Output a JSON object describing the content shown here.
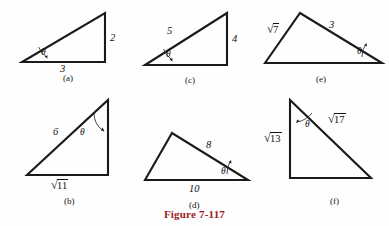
{
  "figure": {
    "caption": "Figure 7-117",
    "caption_color": "#9b1b1b",
    "angle_symbol": "θ",
    "width": 389,
    "height": 226
  },
  "panels": [
    {
      "key": "a",
      "label": "(a)",
      "label_pos": {
        "x": 63,
        "y": 73
      },
      "vertices": [
        {
          "x": 22,
          "y": 62
        },
        {
          "x": 105,
          "y": 62
        },
        {
          "x": 105,
          "y": 13
        }
      ],
      "theta_vertex": {
        "x": 22,
        "y": 62
      },
      "theta_label_pos": {
        "x": 41,
        "y": 47
      },
      "arc": "M 47,57.5 A 26,26 0 0 1 38.5,47",
      "arrow": "M 47.5,58.5 L 44.5,56.6 L 47.4,55.2 Z",
      "sides": [
        {
          "text": "2",
          "x": 110,
          "y": 32,
          "radical": false,
          "italic": true
        },
        {
          "text": "3",
          "x": 60,
          "y": 63,
          "radical": false,
          "italic": true
        }
      ]
    },
    {
      "key": "b",
      "label": "(b)",
      "label_pos": {
        "x": 64,
        "y": 196
      },
      "vertices": [
        {
          "x": 27,
          "y": 175
        },
        {
          "x": 108,
          "y": 175
        },
        {
          "x": 108,
          "y": 100
        }
      ],
      "theta_vertex": {
        "x": 108,
        "y": 100
      },
      "theta_label_pos": {
        "x": 80,
        "y": 127
      },
      "arc": "M 94,112 A 22,22 0 0 0 103.5,131",
      "arrow": "M 104.5,131.5 L 100.8,130.2 L 102.7,127.6 Z",
      "sides": [
        {
          "text": "6",
          "x": 53,
          "y": 126,
          "radical": false,
          "italic": true
        },
        {
          "text": "11",
          "x": 50,
          "y": 178,
          "radical": true,
          "italic": false
        }
      ]
    },
    {
      "key": "c",
      "label": "(c)",
      "label_pos": {
        "x": 185,
        "y": 75
      },
      "vertices": [
        {
          "x": 145,
          "y": 65
        },
        {
          "x": 227,
          "y": 65
        },
        {
          "x": 227,
          "y": 13
        }
      ],
      "theta_vertex": {
        "x": 145,
        "y": 65
      },
      "theta_label_pos": {
        "x": 166,
        "y": 49
      },
      "arc": "M 172,60 A 27,27 0 0 1 163.5,49",
      "arrow": "M 172.5,61.5 L 169.5,59.5 L 172.4,58 Z",
      "sides": [
        {
          "text": "5",
          "x": 167,
          "y": 25,
          "radical": false,
          "italic": true
        },
        {
          "text": "4",
          "x": 232,
          "y": 33,
          "radical": false,
          "italic": true
        }
      ]
    },
    {
      "key": "d",
      "label": "(d)",
      "label_pos": {
        "x": 189,
        "y": 200
      },
      "vertices": [
        {
          "x": 145,
          "y": 180
        },
        {
          "x": 172,
          "y": 133
        },
        {
          "x": 248,
          "y": 180
        }
      ],
      "theta_vertex": {
        "x": 248,
        "y": 180
      },
      "theta_label_pos": {
        "x": 221,
        "y": 166
      },
      "arc": "M 227,174 A 22,22 0 0 1 230.5,161",
      "arrow": "M 231,160 L 231.5,163.5 L 228.6,162.3 Z",
      "sides": [
        {
          "text": "8",
          "x": 206,
          "y": 139,
          "radical": false,
          "italic": true
        },
        {
          "text": "10",
          "x": 189,
          "y": 183,
          "radical": false,
          "italic": true
        }
      ]
    },
    {
      "key": "e",
      "label": "(e)",
      "label_pos": {
        "x": 316,
        "y": 74
      },
      "vertices": [
        {
          "x": 265,
          "y": 63
        },
        {
          "x": 300,
          "y": 13
        },
        {
          "x": 382,
          "y": 63
        }
      ],
      "theta_vertex": {
        "x": 382,
        "y": 63
      },
      "theta_label_pos": {
        "x": 357,
        "y": 46
      },
      "arc": "M 362,57 A 21,21 0 0 1 366,44",
      "arrow": "M 366.5,43 L 367,46.6 L 364.1,45.3 Z",
      "sides": [
        {
          "text": "7",
          "x": 266,
          "y": 22,
          "radical": true,
          "italic": false
        },
        {
          "text": "3",
          "x": 329,
          "y": 19,
          "radical": false,
          "italic": true
        }
      ]
    },
    {
      "key": "f",
      "label": "(f)",
      "label_pos": {
        "x": 330,
        "y": 196
      },
      "vertices": [
        {
          "x": 290,
          "y": 100
        },
        {
          "x": 290,
          "y": 178
        },
        {
          "x": 371,
          "y": 178
        }
      ],
      "theta_vertex": {
        "x": 290,
        "y": 100
      },
      "theta_label_pos": {
        "x": 305,
        "y": 119
      },
      "arc": "M 297,122 A 24,24 0 0 0 312,113",
      "arrow": "M 296,123 L 297.2,119.4 L 299.8,121.2 Z",
      "sides": [
        {
          "text": "13",
          "x": 263,
          "y": 131,
          "radical": true,
          "italic": false
        },
        {
          "text": "17",
          "x": 327,
          "y": 112,
          "radical": true,
          "italic": false
        }
      ]
    }
  ]
}
